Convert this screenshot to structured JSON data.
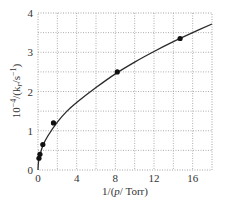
{
  "chart_data": {
    "type": "scatter",
    "title": "",
    "xlabel": "1/(p/Torr)",
    "ylabel": "10^-4/(k_r/s^-1)",
    "xlabel_parts": {
      "pre": "1/(",
      "italic": "p",
      "post": "/ Torr)"
    },
    "ylabel_parts": {
      "pre": "10",
      "sup": "−4",
      "mid": "/(k",
      "sub": "r",
      "post": "/s",
      "sup2": "−1",
      "end": ")"
    },
    "xlim": [
      0,
      18
    ],
    "ylim": [
      0,
      4
    ],
    "xticks": [
      0,
      4,
      8,
      12,
      16
    ],
    "yticks": [
      0,
      1,
      2,
      3,
      4
    ],
    "grid": true,
    "grid_style": "dotted",
    "x_minor_grid": [
      2,
      6,
      10,
      14
    ],
    "y_minor_grid": [
      0.5,
      1.5,
      2.5,
      3.5
    ],
    "series": [
      {
        "name": "data",
        "marker": "circle",
        "x": [
          0.1,
          0.2,
          0.5,
          1.6,
          8.2,
          14.7
        ],
        "y": [
          0.3,
          0.4,
          0.65,
          1.2,
          2.5,
          3.35
        ]
      },
      {
        "name": "fit",
        "style": "line",
        "x": [
          0,
          0.05,
          0.2,
          0.5,
          1,
          2,
          3,
          4,
          6,
          8,
          10,
          12,
          14,
          16,
          18
        ],
        "y": [
          0,
          0.2,
          0.38,
          0.62,
          0.86,
          1.22,
          1.5,
          1.72,
          2.1,
          2.45,
          2.75,
          3.02,
          3.27,
          3.5,
          3.72
        ]
      }
    ],
    "colors": {
      "line": "#2a2a2a",
      "marker": "#111111",
      "grid": "#9a9a9a",
      "text": "#333333"
    }
  }
}
